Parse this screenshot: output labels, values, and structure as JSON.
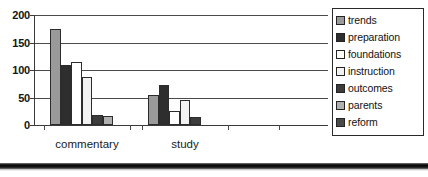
{
  "chart_data": {
    "type": "bar",
    "title": "",
    "subtitle": "",
    "xlabel": "",
    "ylabel": "",
    "categories": [
      "commentary",
      "study"
    ],
    "ylim": [
      0,
      200
    ],
    "yticks": [
      0,
      50,
      100,
      150,
      200
    ],
    "ytick_labels": [
      "0",
      "50",
      "100",
      "150",
      "200"
    ],
    "grid": true,
    "legend_position": "right",
    "series": [
      {
        "name": "trends",
        "values": [
          175,
          55
        ],
        "color": "#9a9a9a"
      },
      {
        "name": "preparation",
        "values": [
          110,
          72
        ],
        "color": "#2e2e2e"
      },
      {
        "name": "foundations",
        "values": [
          115,
          25
        ],
        "color": "#ffffff"
      },
      {
        "name": "instruction",
        "values": [
          88,
          45
        ],
        "color": "#f2f2f2"
      },
      {
        "name": "outcomes",
        "values": [
          18,
          14
        ],
        "color": "#3c3c3c"
      },
      {
        "name": "parents",
        "values": [
          17,
          0
        ],
        "color": "#b0b0b0"
      },
      {
        "name": "reform",
        "values": [
          0,
          0
        ],
        "color": "#4a4a4a"
      }
    ]
  },
  "axis": {
    "y_tick_labels": [
      "200",
      "150",
      "100",
      "50",
      "0"
    ]
  },
  "x_axis": {
    "group_labels": [
      "commentary",
      "study"
    ]
  },
  "legend": {
    "items": [
      {
        "label": "trends"
      },
      {
        "label": "preparation"
      },
      {
        "label": "foundations"
      },
      {
        "label": "instruction"
      },
      {
        "label": "outcomes"
      },
      {
        "label": "parents"
      },
      {
        "label": "reform"
      }
    ]
  }
}
